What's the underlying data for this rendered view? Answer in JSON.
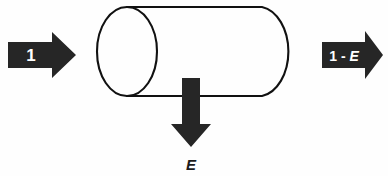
{
  "diagram": {
    "type": "process-flow-cylinder",
    "background_color": "#fefefe",
    "stroke_color": "#111111",
    "arrow_fill_color": "#262626",
    "label_on_arrow_color": "#ffffff",
    "vessel": {
      "name": "cylinder-vessel",
      "shape": "horizontal-cylinder",
      "left_face": "open-ellipse",
      "right_face": "rounded-cap"
    },
    "input_arrow": {
      "name": "input-arrow",
      "direction": "right",
      "label": "1"
    },
    "output_arrow": {
      "name": "output-arrow",
      "direction": "right",
      "label_prefix": "1 - ",
      "label_variable": "E",
      "label_full": "1 - E"
    },
    "extraction_arrow": {
      "name": "extraction-arrow",
      "direction": "down",
      "label": "E"
    }
  }
}
